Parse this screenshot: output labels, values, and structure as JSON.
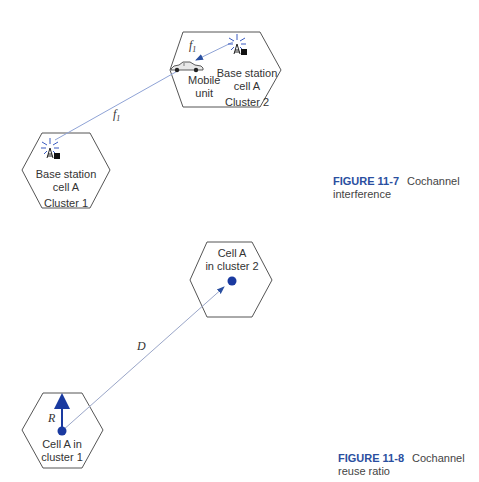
{
  "figure_11_7": {
    "caption_label": "FIGURE 11-7",
    "caption_text_line1": "Cochannel",
    "caption_text_line2": "interference",
    "cluster1_cell": {
      "line1": "Base station",
      "line2": "cell A",
      "line3": "Cluster 1"
    },
    "cluster2_cell": {
      "line1": "Base station",
      "line2": "cell A",
      "line3": "Cluster 2",
      "mobile_line1": "Mobile",
      "mobile_line2": "unit"
    },
    "freq_label": "f",
    "freq_subscript": "1"
  },
  "figure_11_8": {
    "caption_label": "FIGURE 11-8",
    "caption_text": "Cochannel reuse ratio",
    "cell_cluster2": {
      "line1": "Cell A",
      "line2": "in cluster 2"
    },
    "cell_cluster1": {
      "line1": "Cell A in",
      "line2": "cluster 1"
    },
    "distance_label": "D",
    "radius_label": "R"
  },
  "colors": {
    "accent_blue": "#2a4fa0",
    "line_gray": "#555555",
    "dot_blue": "#1a3aa0",
    "signal_line": "#8fa3d6"
  }
}
